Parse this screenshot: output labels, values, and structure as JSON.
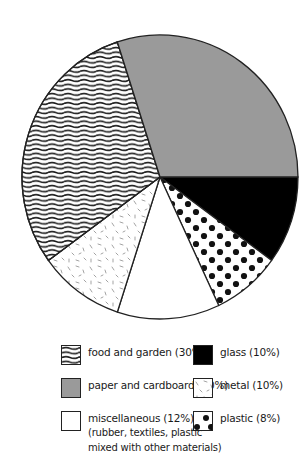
{
  "chart_data": {
    "type": "pie",
    "title": "",
    "categories": [
      "glass",
      "plastic",
      "miscellaneous",
      "metal",
      "food and garden",
      "paper and cardboard"
    ],
    "values": [
      10,
      8,
      12,
      10,
      30,
      30
    ],
    "unit": "%",
    "slices": [
      {
        "name": "glass",
        "value": 10,
        "pattern": "solid-black"
      },
      {
        "name": "plastic",
        "value": 8,
        "pattern": "black-dots"
      },
      {
        "name": "miscellaneous",
        "value": 12,
        "pattern": "white",
        "note": "(rubber, textiles, plastic mixed with other materials)"
      },
      {
        "name": "metal",
        "value": 10,
        "pattern": "speckled-dashes"
      },
      {
        "name": "food and garden",
        "value": 30,
        "pattern": "wavy-lines"
      },
      {
        "name": "paper and cardboard",
        "value": 30,
        "pattern": "solid-gray"
      }
    ],
    "legend_position": "bottom",
    "colors": {
      "glass": "#000000",
      "paper": "#9a9a9a",
      "outline": "#222222",
      "misc": "#ffffff"
    }
  },
  "legend": {
    "food": {
      "label": "food and garden (30%)"
    },
    "paper": {
      "label": "paper and cardboard (30%)"
    },
    "misc": {
      "label": "miscellaneous (12%)",
      "sub1": "(rubber, textiles, plastic",
      "sub2": "mixed with other materials)"
    },
    "glass": {
      "label": "glass (10%)"
    },
    "metal": {
      "label": "metal (10%)"
    },
    "plastic": {
      "label": "plastic (8%)"
    }
  }
}
